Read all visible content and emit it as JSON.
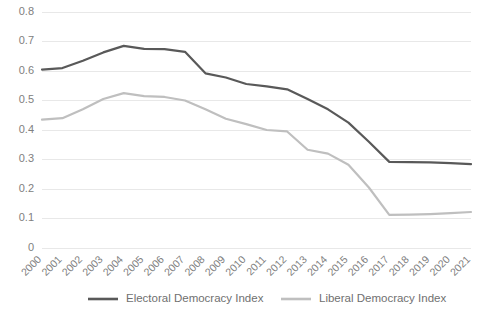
{
  "chart_data": {
    "type": "line",
    "title": "",
    "subtitle": "",
    "xlabel": "",
    "ylabel": "",
    "grid": true,
    "legend_position": "bottom",
    "ylim": [
      0,
      0.8
    ],
    "ytick_labels": [
      "0.8",
      "0.7",
      "0.6",
      "0.5",
      "0.4",
      "0.3",
      "0.2",
      "0.1",
      "0"
    ],
    "ytick_values": [
      0.8,
      0.7,
      0.6,
      0.5,
      0.4,
      0.3,
      0.2,
      0.1,
      0
    ],
    "categories": [
      "2000",
      "2001",
      "2002",
      "2003",
      "2004",
      "2005",
      "2006",
      "2007",
      "2008",
      "2009",
      "2010",
      "2011",
      "2012",
      "2013",
      "2014",
      "2015",
      "2016",
      "2017",
      "2018",
      "2019",
      "2020",
      "2021"
    ],
    "series": [
      {
        "name": "Electoral Democracy Index",
        "color": "#595959",
        "values": [
          0.605,
          0.61,
          0.635,
          0.663,
          0.685,
          0.675,
          0.674,
          0.665,
          0.592,
          0.578,
          0.556,
          0.548,
          0.538,
          0.505,
          0.47,
          0.425,
          0.36,
          0.292,
          0.291,
          0.29,
          0.288,
          0.284
        ]
      },
      {
        "name": "Liberal Democracy Index",
        "color": "#bfbfbf",
        "values": [
          0.435,
          0.44,
          0.47,
          0.505,
          0.525,
          0.515,
          0.512,
          0.5,
          0.47,
          0.438,
          0.42,
          0.4,
          0.395,
          0.333,
          0.32,
          0.282,
          0.205,
          0.112,
          0.113,
          0.115,
          0.118,
          0.122
        ]
      }
    ]
  },
  "legend": {
    "items": [
      {
        "label": "Electoral Democracy Index",
        "color": "#595959"
      },
      {
        "label": "Liberal Democracy Index",
        "color": "#bfbfbf"
      }
    ]
  }
}
